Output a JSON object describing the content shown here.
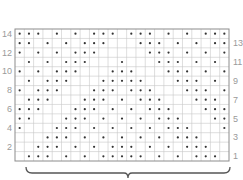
{
  "chart_data": {
    "type": "heatmap",
    "title": "",
    "columns": 23,
    "rows": 14,
    "left_row_labels": [
      "14",
      "12",
      "10",
      "8",
      "6",
      "4",
      "2"
    ],
    "right_row_labels": [
      "13",
      "11",
      "9",
      "7",
      "5",
      "3",
      "1"
    ],
    "grid": true,
    "dots_by_row": {
      "14": [
        1,
        2,
        3,
        5,
        7,
        9,
        10,
        11,
        13,
        14,
        15,
        17,
        19,
        21,
        22,
        23
      ],
      "13": [
        1,
        2,
        4,
        6,
        8,
        9,
        10,
        14,
        15,
        16,
        18,
        20,
        22,
        23
      ],
      "12": [
        1,
        3,
        5,
        7,
        8,
        9,
        15,
        16,
        17,
        19,
        21,
        23
      ],
      "11": [
        2,
        4,
        6,
        7,
        8,
        12,
        16,
        17,
        18,
        20,
        22
      ],
      "10": [
        1,
        3,
        5,
        6,
        7,
        11,
        12,
        13,
        17,
        18,
        19,
        21,
        23
      ],
      "9": [
        2,
        4,
        5,
        6,
        10,
        11,
        12,
        13,
        14,
        18,
        19,
        20,
        22
      ],
      "8": [
        1,
        3,
        4,
        5,
        9,
        10,
        11,
        13,
        14,
        15,
        19,
        20,
        21,
        23
      ],
      "7": [
        2,
        3,
        4,
        8,
        9,
        10,
        12,
        14,
        15,
        16,
        20,
        21,
        22
      ],
      "6": [
        1,
        2,
        3,
        7,
        8,
        9,
        11,
        13,
        15,
        16,
        17,
        21,
        22,
        23
      ],
      "5": [
        1,
        2,
        6,
        7,
        8,
        10,
        12,
        14,
        16,
        17,
        18,
        22,
        23
      ],
      "4": [
        1,
        5,
        6,
        7,
        9,
        11,
        13,
        15,
        17,
        18,
        19,
        23
      ],
      "3": [
        4,
        5,
        6,
        8,
        10,
        12,
        14,
        16,
        18,
        19,
        20
      ],
      "2": [
        3,
        4,
        5,
        7,
        9,
        11,
        12,
        13,
        15,
        17,
        19,
        20,
        21
      ],
      "1": [
        2,
        3,
        4,
        6,
        8,
        10,
        11,
        12,
        13,
        14,
        16,
        18,
        20,
        21,
        22
      ]
    },
    "brace": "repeat"
  },
  "colors": {
    "grid_line": "#c8c8c8",
    "border": "#8c8c8c",
    "dot": "#333333",
    "label": "#9a9a9a",
    "brace": "#555555"
  }
}
